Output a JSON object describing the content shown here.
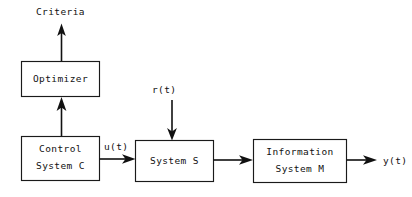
{
  "diagram": {
    "background_color": "#ffffff",
    "line_color": "#111111",
    "text_color": "#111111",
    "blocks": [
      {
        "id": "optimizer",
        "line1": "Optimizer",
        "line2": ""
      },
      {
        "id": "control",
        "line1": "Control",
        "line2": "System C"
      },
      {
        "id": "system_s",
        "line1": "System S",
        "line2": ""
      },
      {
        "id": "info",
        "line1": "Information",
        "line2": "System M"
      }
    ],
    "signals": {
      "criteria": "Criteria",
      "reference": "r(t)",
      "control_input": "u(t)",
      "output": "y(t)"
    }
  }
}
